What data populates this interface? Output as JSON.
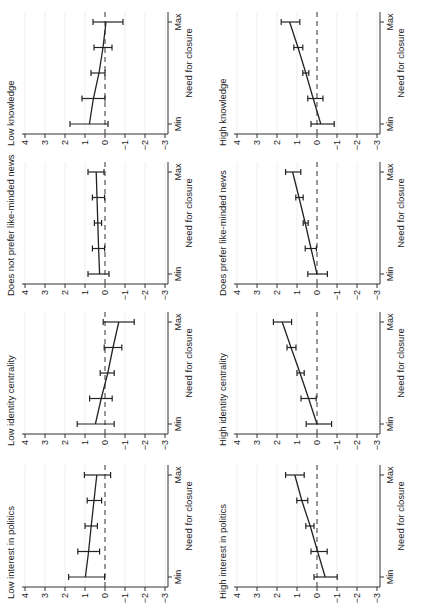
{
  "figure": {
    "layout": {
      "columns": 2,
      "rows": 4,
      "rotation_deg": -90
    },
    "shared": {
      "xlabel": "Need for closure",
      "x_tick_labels": [
        "Min",
        "Max"
      ],
      "y_ticks": [
        -3,
        -2,
        -1,
        0,
        1,
        2,
        3,
        4
      ],
      "y_tick_labels": [
        "−3",
        "−2",
        "−1",
        "0",
        "1",
        "2",
        "3",
        "4"
      ],
      "ylim": [
        -3,
        4
      ],
      "reference_line": 0
    },
    "colors": {
      "line": "#222222",
      "dash": "#555555",
      "grid": "#eeeeee",
      "axis": "#333333"
    }
  },
  "chart_data": [
    {
      "type": "line",
      "title": "Low knowledge",
      "xlabel": "Need for closure",
      "ylabel": "",
      "x": [
        1,
        2,
        3,
        4,
        5
      ],
      "x_tick_labels": [
        "Min",
        "Max"
      ],
      "ylim": [
        -3,
        4
      ],
      "yticks": [
        -3,
        -2,
        -1,
        0,
        1,
        2,
        3,
        4
      ],
      "series": [
        {
          "name": "Marginal effect",
          "values": [
            0.78,
            0.58,
            0.3,
            0.1,
            -0.05
          ],
          "ci_low": [
            -0.15,
            0.0,
            0.0,
            -0.35,
            -0.9
          ],
          "ci_high": [
            1.75,
            1.15,
            0.7,
            0.55,
            0.6
          ]
        }
      ],
      "reference_line": 0,
      "position": {
        "col": 0,
        "row": 0
      }
    },
    {
      "type": "line",
      "title": "Does not prefer like-minded news",
      "xlabel": "Need for closure",
      "ylabel": "",
      "x": [
        1,
        2,
        3,
        4,
        5
      ],
      "x_tick_labels": [
        "Min",
        "Max"
      ],
      "ylim": [
        -3,
        4
      ],
      "yticks": [
        -3,
        -2,
        -1,
        0,
        1,
        2,
        3,
        4
      ],
      "series": [
        {
          "name": "Marginal effect",
          "values": [
            0.27,
            0.32,
            0.36,
            0.4,
            0.44
          ],
          "ci_low": [
            -0.2,
            0.02,
            0.17,
            0.02,
            0.05
          ],
          "ci_high": [
            0.85,
            0.63,
            0.53,
            0.63,
            0.85
          ]
        }
      ],
      "reference_line": 0,
      "position": {
        "col": 0,
        "row": 1
      }
    },
    {
      "type": "line",
      "title": "Low identity centrality",
      "xlabel": "Need for closure",
      "ylabel": "",
      "x": [
        1,
        2,
        3,
        4,
        5
      ],
      "x_tick_labels": [
        "Min",
        "Max"
      ],
      "ylim": [
        -3,
        4
      ],
      "yticks": [
        -3,
        -2,
        -1,
        0,
        1,
        2,
        3,
        4
      ],
      "series": [
        {
          "name": "Marginal effect",
          "values": [
            0.48,
            0.19,
            -0.14,
            -0.4,
            -0.69
          ],
          "ci_low": [
            -0.46,
            -0.36,
            -0.46,
            -0.84,
            -1.46
          ],
          "ci_high": [
            1.39,
            0.77,
            0.24,
            0.04,
            0.09
          ]
        }
      ],
      "reference_line": 0,
      "position": {
        "col": 0,
        "row": 2
      }
    },
    {
      "type": "line",
      "title": "Low interest in politics",
      "xlabel": "Need for closure",
      "ylabel": "",
      "x": [
        1,
        2,
        3,
        4,
        5
      ],
      "x_tick_labels": [
        "Min",
        "Max"
      ],
      "ylim": [
        -3,
        4
      ],
      "yticks": [
        -3,
        -2,
        -1,
        0,
        1,
        2,
        3,
        4
      ],
      "series": [
        {
          "name": "Marginal effect",
          "values": [
            0.98,
            0.82,
            0.69,
            0.55,
            0.41
          ],
          "ci_low": [
            0.02,
            0.27,
            0.38,
            0.17,
            -0.28
          ],
          "ci_high": [
            1.82,
            1.36,
            1.0,
            0.89,
            1.03
          ]
        }
      ],
      "reference_line": 0,
      "position": {
        "col": 0,
        "row": 3
      }
    },
    {
      "type": "line",
      "title": "High knowledge",
      "xlabel": "Need for closure",
      "ylabel": "",
      "x": [
        1,
        2,
        3,
        4,
        5
      ],
      "x_tick_labels": [
        "Min",
        "Max"
      ],
      "ylim": [
        -3,
        4
      ],
      "yticks": [
        -3,
        -2,
        -1,
        0,
        1,
        2,
        3,
        4
      ],
      "series": [
        {
          "name": "Marginal effect",
          "values": [
            -0.19,
            0.19,
            0.56,
            0.95,
            1.37
          ],
          "ci_low": [
            -0.86,
            -0.3,
            0.41,
            0.71,
            0.86
          ],
          "ci_high": [
            0.3,
            0.46,
            0.71,
            1.16,
            1.79
          ]
        }
      ],
      "reference_line": 0,
      "position": {
        "col": 1,
        "row": 0
      }
    },
    {
      "type": "line",
      "title": "Does prefer like-minded news",
      "xlabel": "Need for closure",
      "ylabel": "",
      "x": [
        1,
        2,
        3,
        4,
        5
      ],
      "x_tick_labels": [
        "Min",
        "Max"
      ],
      "ylim": [
        -3,
        4
      ],
      "yticks": [
        -3,
        -2,
        -1,
        0,
        1,
        2,
        3,
        4
      ],
      "series": [
        {
          "name": "Marginal effect",
          "values": [
            0.0,
            0.3,
            0.59,
            0.9,
            1.22
          ],
          "ci_low": [
            -0.52,
            0.03,
            0.44,
            0.69,
            0.81
          ],
          "ci_high": [
            0.46,
            0.59,
            0.69,
            1.06,
            1.57
          ]
        }
      ],
      "reference_line": 0,
      "position": {
        "col": 1,
        "row": 1
      }
    },
    {
      "type": "line",
      "title": "High identity centrality",
      "xlabel": "Need for closure",
      "ylabel": "",
      "x": [
        1,
        2,
        3,
        4,
        5
      ],
      "x_tick_labels": [
        "Min",
        "Max"
      ],
      "ylim": [
        -3,
        4
      ],
      "yticks": [
        -3,
        -2,
        -1,
        0,
        1,
        2,
        3,
        4
      ],
      "series": [
        {
          "name": "Marginal effect",
          "values": [
            0.0,
            0.42,
            0.85,
            1.3,
            1.74
          ],
          "ci_low": [
            -0.73,
            0.04,
            0.64,
            1.05,
            1.27
          ],
          "ci_high": [
            0.54,
            0.8,
            1.0,
            1.5,
            2.18
          ]
        }
      ],
      "reference_line": 0,
      "position": {
        "col": 1,
        "row": 2
      }
    },
    {
      "type": "line",
      "title": "High interest in politics",
      "xlabel": "Need for closure",
      "ylabel": "",
      "x": [
        1,
        2,
        3,
        4,
        5
      ],
      "x_tick_labels": [
        "Min",
        "Max"
      ],
      "ylim": [
        -3,
        4
      ],
      "yticks": [
        -3,
        -2,
        -1,
        0,
        1,
        2,
        3,
        4
      ],
      "series": [
        {
          "name": "Marginal effect",
          "values": [
            -0.41,
            -0.03,
            0.34,
            0.76,
            1.11
          ],
          "ci_low": [
            -1.01,
            -0.51,
            0.15,
            0.46,
            0.64
          ],
          "ci_high": [
            0.15,
            0.3,
            0.56,
            1.01,
            1.57
          ]
        }
      ],
      "reference_line": 0,
      "position": {
        "col": 1,
        "row": 3
      }
    }
  ]
}
